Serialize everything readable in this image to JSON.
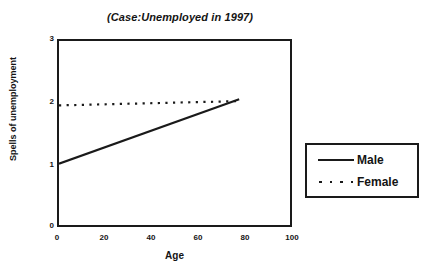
{
  "chart_data": {
    "type": "line",
    "title": "(Case:Unemployed in 1997)",
    "xlabel": "Age",
    "ylabel": "Spells of unemployment",
    "xlim": [
      0,
      100
    ],
    "ylim": [
      0,
      3
    ],
    "xticks": [
      "0",
      "20",
      "40",
      "60",
      "80",
      "100"
    ],
    "yticks": [
      "0",
      "1",
      "2",
      "3"
    ],
    "grid": false,
    "legend_position": "right",
    "series": [
      {
        "name": "Male",
        "style": "solid",
        "color": "#1a1a1a",
        "x": [
          0,
          78
        ],
        "values": [
          1.0,
          2.05
        ]
      },
      {
        "name": "Female",
        "style": "dotted",
        "color": "#1a1a1a",
        "x": [
          0,
          78
        ],
        "values": [
          1.95,
          2.02
        ]
      }
    ]
  },
  "legend": {
    "items": [
      {
        "label": "Male"
      },
      {
        "label": "Female"
      }
    ]
  }
}
